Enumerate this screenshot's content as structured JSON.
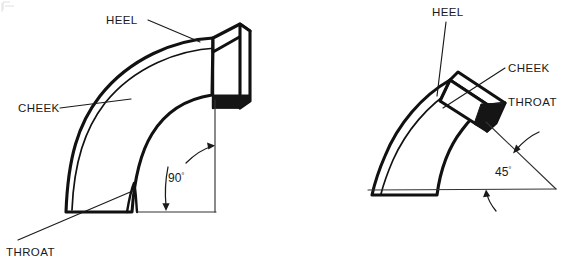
{
  "figure": {
    "background_color": "#ffffff",
    "line_color": "#111111",
    "label_color": "#1a1a1a"
  },
  "diagrams": [
    {
      "id": "ninety-degree-elbow",
      "name": "90 degree elbow",
      "angle_value": "90",
      "degree_symbol": "°",
      "labels": {
        "heel": "HEEL",
        "cheek": "CHEEK",
        "throat": "THROAT"
      }
    },
    {
      "id": "forty-five-degree-elbow",
      "name": "45 degree elbow",
      "angle_value": "45",
      "degree_symbol": "°",
      "labels": {
        "heel": "HEEL",
        "cheek": "CHEEK",
        "throat": "THROAT"
      }
    }
  ]
}
